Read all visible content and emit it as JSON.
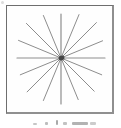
{
  "window": {
    "width": 121,
    "height": 128,
    "background": "#ffffff"
  },
  "figure": {
    "name": "starburst-radiating-lines",
    "description_type": "line-diagram",
    "frame_color": "#6e6e6e",
    "inner_background": "#fefefe",
    "line_color": "#8d8d8d",
    "center_dot_color": "#454545",
    "center": {
      "x": 54,
      "y": 52
    },
    "num_lines": 8,
    "num_rays": 16,
    "angle_step_deg": 22.5,
    "default_stroke_width": 1,
    "rays": [
      {
        "angle_deg": 0,
        "length": 44,
        "width": 1.2
      },
      {
        "angle_deg": 22.5,
        "length": 45
      },
      {
        "angle_deg": 45,
        "length": 50
      },
      {
        "angle_deg": 67.5,
        "length": 47
      },
      {
        "angle_deg": 90,
        "length": 44,
        "width": 1.2
      },
      {
        "angle_deg": 112.5,
        "length": 46
      },
      {
        "angle_deg": 135,
        "length": 49
      },
      {
        "angle_deg": 157.5,
        "length": 46
      },
      {
        "angle_deg": 180,
        "length": 44,
        "width": 1.2
      },
      {
        "angle_deg": 202.5,
        "length": 44
      },
      {
        "angle_deg": 225,
        "length": 48
      },
      {
        "angle_deg": 247.5,
        "length": 46
      },
      {
        "angle_deg": 270,
        "length": 46,
        "width": 1.2
      },
      {
        "angle_deg": 292.5,
        "length": 45
      },
      {
        "angle_deg": 315,
        "length": 47
      },
      {
        "angle_deg": 337.5,
        "length": 44
      }
    ],
    "caption": {
      "text": "",
      "legibility": "illegible fragments cropped at bottom edge"
    }
  }
}
